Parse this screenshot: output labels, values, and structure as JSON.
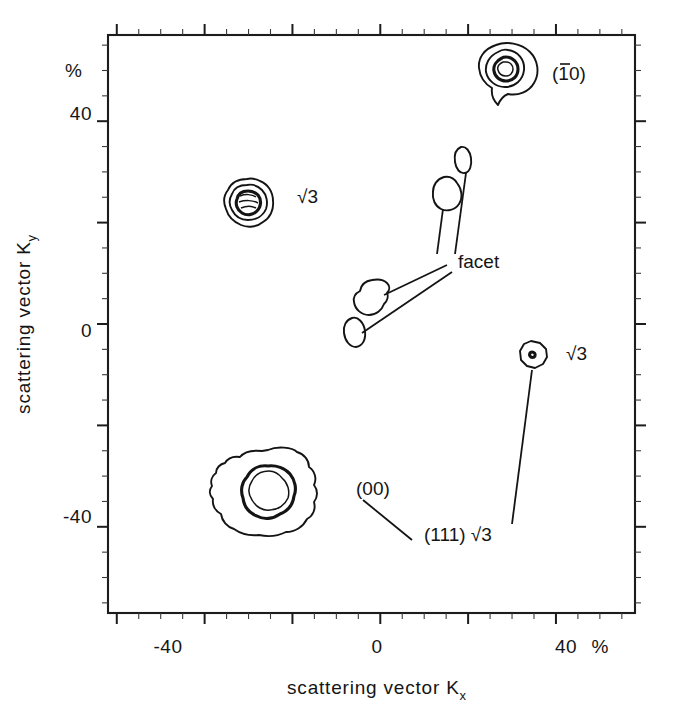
{
  "figure": {
    "kind": "contour-plot",
    "background": "#ffffff",
    "ink_color": "#141414"
  },
  "axes": {
    "x": {
      "title": "scattering  vector K",
      "title_sub": "x",
      "unit_label": "%",
      "tick_labels": [
        "-40",
        "0",
        "40"
      ],
      "tick_values": [
        -40,
        0,
        40
      ],
      "range": [
        -62,
        58
      ],
      "major_step": 20,
      "minor_step": 5
    },
    "y": {
      "title": "scattering  vector K",
      "title_sub": "y",
      "unit_label": "%",
      "tick_labels": [
        "40",
        "0",
        "-40"
      ],
      "tick_values": [
        40,
        0,
        -40
      ],
      "range": [
        -57,
        57
      ],
      "major_step": 20,
      "minor_step": 5
    }
  },
  "annotations": [
    {
      "id": "spot-1bar0",
      "text": "(10)",
      "prefix": "(",
      "overbar_char": "1",
      "rest": "0)",
      "x": 552,
      "y": 80
    },
    {
      "id": "sqrt3-upper-left",
      "text": "√3",
      "x": 297,
      "y": 203
    },
    {
      "id": "facet",
      "text": "facet",
      "x": 458,
      "y": 268
    },
    {
      "id": "sqrt3-right",
      "text": "√3",
      "x": 566,
      "y": 360
    },
    {
      "id": "spot-00",
      "text": "(00)",
      "x": 356,
      "y": 495
    },
    {
      "id": "spot-111-sqrt3",
      "text": "(111) √3",
      "x": 424,
      "y": 541
    }
  ],
  "chart_data": {
    "type": "contour",
    "title": "",
    "xlabel": "scattering vector Kx",
    "ylabel": "scattering vector Ky",
    "xlim": [
      -62,
      58
    ],
    "ylim": [
      -57,
      57
    ],
    "xticks": [
      -40,
      0,
      40
    ],
    "yticks": [
      -40,
      0,
      40
    ],
    "grid": false,
    "units": "%",
    "legend": "none",
    "spots": [
      {
        "label": "(10)",
        "note": "(1-bar 0) diffraction spot",
        "kx": 30,
        "ky": 46,
        "rings": 3,
        "intensity": "high",
        "shape": "teardrop"
      },
      {
        "label": "√3",
        "note": "sqrt-3 superstructure spot upper-left",
        "kx": -19,
        "ky": 23,
        "rings": 4,
        "intensity": "medium",
        "shape": "rounded-polygon"
      },
      {
        "label": "facet",
        "note": "facet streak spot, upper",
        "kx": 12,
        "ky": 28,
        "rings": 1,
        "intensity": "low",
        "shape": "small-oval"
      },
      {
        "label": "facet",
        "note": "facet streak spot, upper-mid",
        "kx": 9,
        "ky": 21,
        "rings": 1,
        "intensity": "low",
        "shape": "blob"
      },
      {
        "label": "facet",
        "note": "facet streak spot, lower-mid",
        "kx": -3,
        "ky": 6,
        "rings": 1,
        "intensity": "low",
        "shape": "blob"
      },
      {
        "label": "facet",
        "note": "facet streak spot, lower",
        "kx": -7,
        "ky": -1,
        "rings": 1,
        "intensity": "low",
        "shape": "small-oval"
      },
      {
        "label": "(111) √3",
        "note": "sqrt-3 spot right of centre",
        "kx": 27,
        "ky": -5,
        "rings": 2,
        "intensity": "medium",
        "shape": "octagon"
      },
      {
        "label": "(00)",
        "note": "specular (00) beam",
        "kx": -23,
        "ky": -28,
        "rings": 2,
        "intensity": "very-high",
        "shape": "large-irregular"
      }
    ]
  }
}
